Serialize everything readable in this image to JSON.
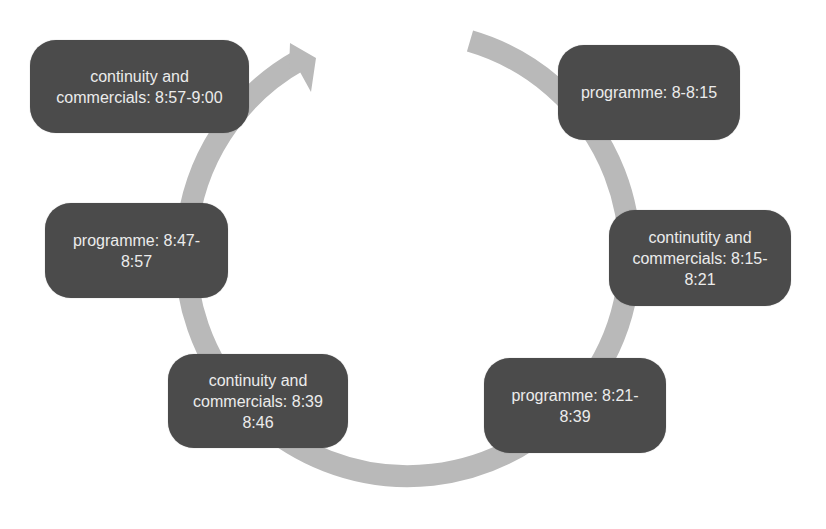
{
  "diagram": {
    "type": "cycle",
    "direction": "clockwise",
    "ring_color": "#b9b9b9",
    "node_color": "#4b4b4b",
    "node_text_color": "#ececec",
    "nodes": [
      {
        "id": "n1",
        "label": "programme: 8-8:15"
      },
      {
        "id": "n2",
        "label": "continutity and\ncommercials: 8:15-\n8:21"
      },
      {
        "id": "n3",
        "label": "programme: 8:21-\n8:39"
      },
      {
        "id": "n4",
        "label": "continuity and\ncommercials: 8:39\n8:46"
      },
      {
        "id": "n5",
        "label": "programme: 8:47-\n8:57"
      },
      {
        "id": "n6",
        "label": "continuity and\ncommercials: 8:57-9:00"
      }
    ]
  }
}
